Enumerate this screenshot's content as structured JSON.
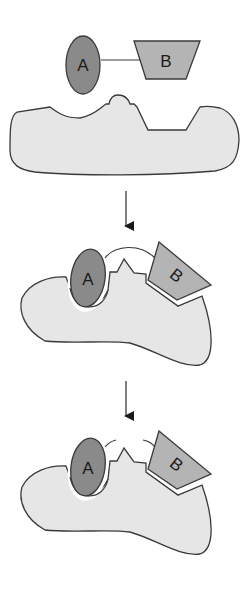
{
  "diagram": {
    "title": "",
    "colors": {
      "substrate_a": "#8a8a8a",
      "substrate_b": "#b4b4b4",
      "enzyme": "#e6e6e6",
      "outline": "#3a3a3a",
      "background": "#ffffff"
    },
    "stages": [
      {
        "id": "stage-1",
        "description": "Substrates A and B linked, separate from enzyme",
        "substrate_a_label": "A",
        "substrate_b_label": "B"
      },
      {
        "id": "stage-2",
        "description": "Substrates bound to enzyme active site, strained bond",
        "substrate_a_label": "A",
        "substrate_b_label": "B"
      },
      {
        "id": "stage-3",
        "description": "Bond broken, products A and B on enzyme",
        "substrate_a_label": "A",
        "substrate_b_label": "B"
      }
    ],
    "arrows": [
      {
        "id": "arrow-1",
        "from": "stage-1",
        "to": "stage-2",
        "icon": "down-arrow-icon"
      },
      {
        "id": "arrow-2",
        "from": "stage-2",
        "to": "stage-3",
        "icon": "down-arrow-icon"
      }
    ]
  }
}
